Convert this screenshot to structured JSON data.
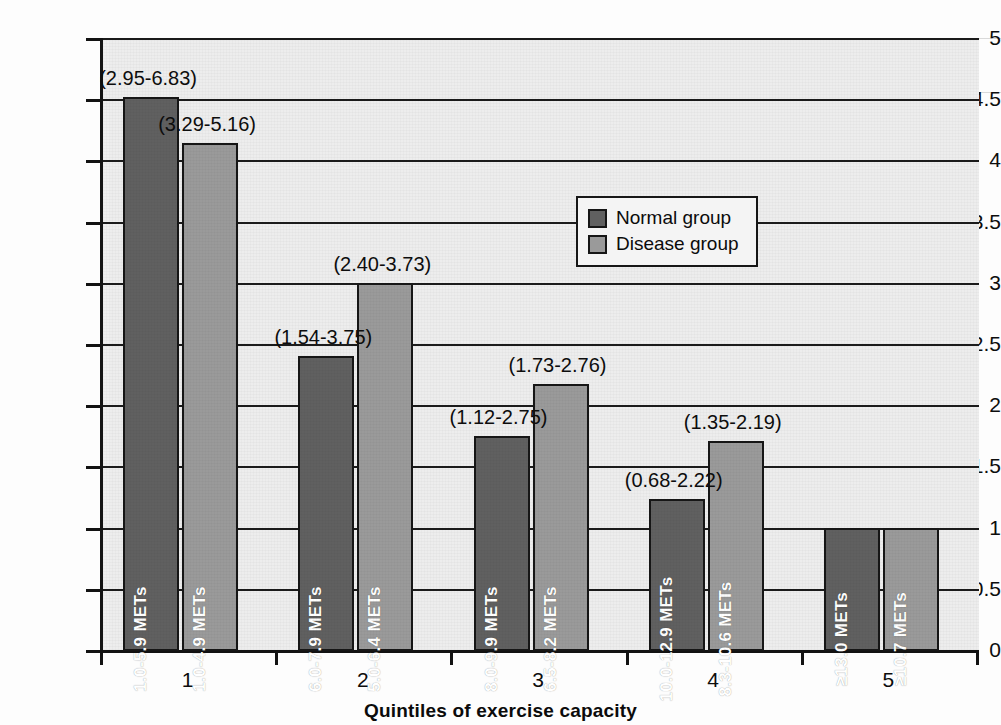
{
  "chart_data": {
    "type": "bar",
    "title": "",
    "xlabel": "Quintiles of exercise capacity",
    "ylabel": "Relative risk",
    "categories": [
      "1",
      "2",
      "3",
      "4",
      "5"
    ],
    "ylim": [
      0,
      5
    ],
    "ytick_labels": [
      "0",
      "0.5",
      "1",
      "1.5",
      "2",
      "2.5",
      "3",
      "3.5",
      "4",
      "4.5",
      "5"
    ],
    "ytick_values": [
      0,
      0.5,
      1,
      1.5,
      2,
      2.5,
      3,
      3.5,
      4,
      4.5,
      5
    ],
    "grid": "horizontal",
    "legend_position": "upper-center-right",
    "series": [
      {
        "name": "Normal group",
        "color": "#606060",
        "values": [
          4.52,
          2.4,
          1.75,
          1.23,
          1.0
        ],
        "ci_labels": [
          "(2.95-6.83)",
          "(1.54-3.75)",
          "(1.12-2.75)",
          "(0.68-2.22)",
          ""
        ],
        "bar_labels": [
          "1.0-5.9 METs",
          "6.0-7.9 METs",
          "8.0-9.9 METs",
          "10.0-12.9 METs",
          "≥13.0 METs"
        ]
      },
      {
        "name": "Disease group",
        "color": "#9a9a9a",
        "values": [
          4.14,
          3.0,
          2.17,
          1.71,
          1.0
        ],
        "ci_labels": [
          "(3.29-5.16)",
          "(2.40-3.73)",
          "(1.73-2.76)",
          "(1.35-2.19)",
          ""
        ],
        "bar_labels": [
          "1.0-4.9 METs",
          "5.0-6.4 METs",
          "6.5-8.2 METs",
          "8.3-10.6 METs",
          "≥10.7 METs"
        ]
      }
    ]
  },
  "legend": {
    "entries": [
      {
        "label": "Normal group"
      },
      {
        "label": "Disease group"
      }
    ]
  },
  "showthrough": {
    "title": "VE RISKS OF DEATH  AMONG HARVARD ALUMNI, BY PATTERNS OF PHYSICAL ACTIVITY",
    "fragments": [
      "Study group",
      "No. of",
      "Deaths",
      "Relative",
      "risk",
      "Sedentary",
      "Moderate",
      "Vigorous"
    ]
  }
}
